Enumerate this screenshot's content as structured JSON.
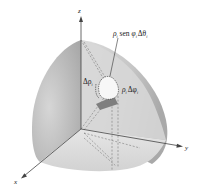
{
  "figure": {
    "axes": {
      "x_label": "x",
      "y_label": "y",
      "z_label": "z"
    },
    "labels": {
      "arc_theta": {
        "rho": "ρ",
        "sub_i": "i",
        "sen": " sen ",
        "phi": "φ",
        "delta_theta": "Δθ"
      },
      "delta_rho": {
        "delta_rho": "Δρ",
        "sub_i": "i"
      },
      "arc_phi": {
        "rho": "ρ",
        "sub_i": "i",
        "delta_phi": "Δφ"
      }
    },
    "colors": {
      "surface_light": "#e2e2e2",
      "surface_mid": "#c4c4c4",
      "surface_dark": "#9a9a9a",
      "axis": "#444444",
      "dashed": "#777777",
      "element_fill": "#f5f5f5",
      "element_shadow": "#808080"
    }
  }
}
